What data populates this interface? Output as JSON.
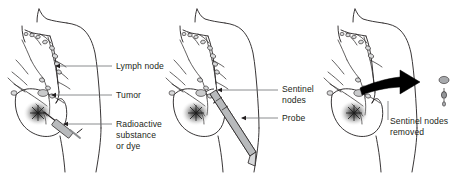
{
  "figure": {
    "background_color": "#ffffff",
    "text_color": "#231f20",
    "outline_color": "#231f20",
    "instrument_color": "#a7a9ac",
    "node_color": "#939598",
    "arrow_color": "#000000",
    "panel_count": 3
  },
  "panels": [
    {
      "id": "panel-injection",
      "name": "Radioactive substance or dye injection",
      "labels": [
        {
          "id": "lymph-node",
          "text": "Lymph node"
        },
        {
          "id": "tumor",
          "text": "Tumor"
        },
        {
          "id": "radioactive",
          "line1": "Radioactive",
          "line2": "substance",
          "line3": "or dye",
          "text": "Radioactive substance or dye"
        }
      ],
      "features": [
        "torso-outline",
        "breast-outline",
        "lymphatic-network",
        "tumor-blotch",
        "syringe"
      ]
    },
    {
      "id": "panel-probe",
      "name": "Probe detecting sentinel nodes",
      "labels": [
        {
          "id": "sentinel-nodes",
          "line1": "Sentinel",
          "line2": "nodes",
          "text": "Sentinel nodes"
        },
        {
          "id": "probe",
          "text": "Probe"
        }
      ],
      "features": [
        "torso-outline",
        "breast-outline",
        "lymphatic-network",
        "tumor-blotch",
        "gamma-probe"
      ]
    },
    {
      "id": "panel-removal",
      "name": "Sentinel nodes removed",
      "labels": [
        {
          "id": "sentinel-nodes-removed",
          "line1": "Sentinel nodes",
          "line2": "removed",
          "text": "Sentinel nodes removed"
        }
      ],
      "features": [
        "torso-outline",
        "breast-outline",
        "lymphatic-network",
        "tumor-blotch",
        "black-arrow",
        "extracted-nodes"
      ]
    }
  ]
}
